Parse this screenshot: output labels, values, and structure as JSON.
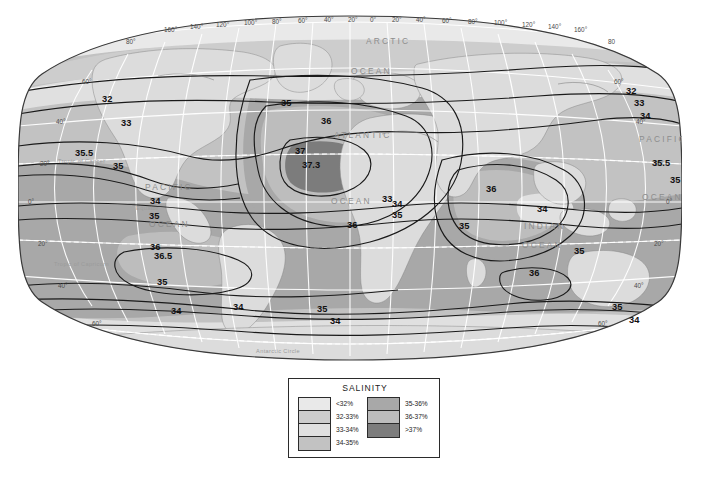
{
  "figure": {
    "kind": "thematic-world-map"
  },
  "map": {
    "projection_shape": "oval (Robinson-like) world map",
    "background_color": "#ffffff",
    "outline_color": "#3a3a3a",
    "graticule_color": "#ffffff",
    "ocean_labels": [
      {
        "text": "ARCTIC",
        "x": 348,
        "y": 30
      },
      {
        "text": "OCEAN",
        "x": 333,
        "y": 60
      },
      {
        "text": "ATLANTIC",
        "x": 316,
        "y": 124
      },
      {
        "text": "OCEAN",
        "x": 313,
        "y": 190
      },
      {
        "text": "PACIFIC",
        "x": 127,
        "y": 176
      },
      {
        "text": "OCEAN",
        "x": 131,
        "y": 213
      },
      {
        "text": "INDIAN",
        "x": 506,
        "y": 215
      },
      {
        "text": "OCEAN",
        "x": 504,
        "y": 234
      },
      {
        "text": "PACIFIC",
        "x": 621,
        "y": 128
      },
      {
        "text": "OCEAN",
        "x": 624,
        "y": 186
      }
    ],
    "reference_lines": [
      {
        "text": "Tropic of Cancer",
        "x": 40,
        "y": 149
      },
      {
        "text": "Equator",
        "x": 118,
        "y": 196
      },
      {
        "text": "Tropic of Capricorn",
        "x": 36,
        "y": 252
      },
      {
        "text": "Antarctic Circle",
        "x": 238,
        "y": 339
      }
    ],
    "longitude_labels": [
      "160°",
      "140°",
      "120°",
      "100°",
      "80°",
      "60°",
      "40°",
      "20°",
      "0°",
      "20°",
      "40°",
      "60°",
      "80°",
      "100°",
      "120°",
      "140°",
      "160°"
    ],
    "latitude_labels_left": [
      "80°",
      "60°",
      "40°",
      "20°",
      "0°",
      "20°",
      "40°",
      "60°"
    ],
    "latitude_labels_right": [
      "80",
      "60°",
      "40°",
      "20°",
      "0°",
      "20°",
      "40°",
      "60°"
    ],
    "contour_labels": [
      {
        "value": "32",
        "x": 84,
        "y": 88
      },
      {
        "value": "33",
        "x": 103,
        "y": 112
      },
      {
        "value": "35.5",
        "x": 57,
        "y": 142
      },
      {
        "value": "35",
        "x": 95,
        "y": 155
      },
      {
        "value": "34",
        "x": 132,
        "y": 190
      },
      {
        "value": "35",
        "x": 131,
        "y": 205
      },
      {
        "value": "36",
        "x": 132,
        "y": 236
      },
      {
        "value": "36.5",
        "x": 136,
        "y": 245
      },
      {
        "value": "35",
        "x": 139,
        "y": 271
      },
      {
        "value": "34",
        "x": 153,
        "y": 300
      },
      {
        "value": "34",
        "x": 215,
        "y": 296
      },
      {
        "value": "35",
        "x": 299,
        "y": 298
      },
      {
        "value": "34",
        "x": 312,
        "y": 310
      },
      {
        "value": "35",
        "x": 263,
        "y": 92
      },
      {
        "value": "36",
        "x": 303,
        "y": 110
      },
      {
        "value": "37",
        "x": 277,
        "y": 140
      },
      {
        "value": "37.3",
        "x": 284,
        "y": 154
      },
      {
        "value": "36",
        "x": 329,
        "y": 214
      },
      {
        "value": "35",
        "x": 374,
        "y": 204
      },
      {
        "value": "34",
        "x": 374,
        "y": 193
      },
      {
        "value": "33",
        "x": 364,
        "y": 188
      },
      {
        "value": "36",
        "x": 468,
        "y": 178
      },
      {
        "value": "35",
        "x": 441,
        "y": 215
      },
      {
        "value": "34",
        "x": 519,
        "y": 198
      },
      {
        "value": "35",
        "x": 556,
        "y": 240
      },
      {
        "value": "36",
        "x": 511,
        "y": 262
      },
      {
        "value": "32",
        "x": 608,
        "y": 80
      },
      {
        "value": "33",
        "x": 616,
        "y": 92
      },
      {
        "value": "34",
        "x": 622,
        "y": 105
      },
      {
        "value": "35.5",
        "x": 648,
        "y": 152
      },
      {
        "value": "35",
        "x": 668,
        "y": 169
      },
      {
        "value": "35",
        "x": 594,
        "y": 296
      },
      {
        "value": "34",
        "x": 611,
        "y": 309
      }
    ]
  },
  "legend": {
    "title": "SALINITY",
    "left_column": [
      {
        "label": "<32%",
        "color": "#e9e9e9"
      },
      {
        "label": "32-33%",
        "color": "#cdcdcd"
      },
      {
        "label": "33-34%",
        "color": "#e0e0e0"
      },
      {
        "label": "34-35%",
        "color": "#c2c2c2"
      }
    ],
    "right_column": [
      {
        "label": "35-36%",
        "color": "#a8a8a8"
      },
      {
        "label": "36-37%",
        "color": "#bdbdbd"
      },
      {
        "label": ">37%",
        "color": "#7d7d7d"
      }
    ]
  },
  "palette": {
    "lt_32": "#e9e9e9",
    "c32_33": "#cdcdcd",
    "c33_34": "#e0e0e0",
    "c34_35": "#c2c2c2",
    "c35_36": "#a8a8a8",
    "c36_37": "#bdbdbd",
    "gt_37": "#7d7d7d",
    "land": "#dcdcdc",
    "outline": "#3a3a3a"
  }
}
